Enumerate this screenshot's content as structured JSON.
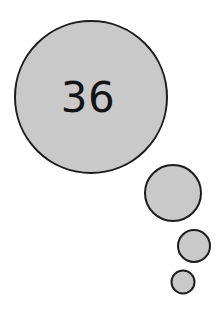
{
  "figure": {
    "kind": "thought-bubble",
    "background_color": "#ffffff",
    "fill_color": "#c9c9c9",
    "stroke_color": "#1c1c1c",
    "stroke_width": 2,
    "label_color": "#141414"
  },
  "main_bubble": {
    "label": "36",
    "center_x": 91,
    "center_y": 97,
    "radius": 77,
    "font_size": 42
  },
  "trail_bubbles": [
    {
      "name": "trail-bubble-1",
      "center_x": 173,
      "center_y": 193,
      "radius": 29
    },
    {
      "name": "trail-bubble-2",
      "center_x": 194,
      "center_y": 246,
      "radius": 17
    },
    {
      "name": "trail-bubble-3",
      "center_x": 183,
      "center_y": 282,
      "radius": 12.5
    }
  ],
  "chart_data": {
    "type": "bar",
    "title": "",
    "xlabel": "",
    "ylabel": "",
    "categories": [
      "main-bubble",
      "trail-1",
      "trail-2",
      "trail-3"
    ],
    "values": [
      77,
      29,
      17,
      12.5
    ],
    "value_label": "36"
  }
}
